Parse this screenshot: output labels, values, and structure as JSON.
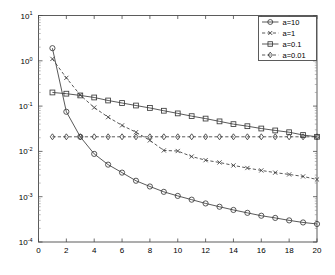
{
  "chart_data": {
    "type": "line",
    "title": "",
    "xlabel": "",
    "ylabel": "",
    "xlim": [
      0,
      20
    ],
    "ylim": [
      0.0001,
      10
    ],
    "yscale": "log",
    "xscale": "linear",
    "grid": false,
    "legend_position": "top-right",
    "x_ticks": [
      0,
      2,
      4,
      6,
      8,
      10,
      12,
      14,
      16,
      18,
      20
    ],
    "x_tick_labels": [
      "0",
      "2",
      "4",
      "6",
      "8",
      "10",
      "12",
      "14",
      "16",
      "18",
      "20"
    ],
    "y_ticks": [
      10,
      1,
      0.1,
      0.01,
      0.001,
      0.0001
    ],
    "y_tick_labels": [
      "10^1",
      "10^0",
      "10^-1",
      "10^-2",
      "10^-3",
      "10^-4"
    ],
    "y_tick_mantissa": [
      "10",
      "10",
      "10",
      "10",
      "10",
      "10"
    ],
    "y_tick_exponent": [
      "1",
      "0",
      "-1",
      "-2",
      "-3",
      "-4"
    ],
    "x": [
      1,
      2,
      3,
      4,
      5,
      6,
      7,
      8,
      9,
      10,
      11,
      12,
      13,
      14,
      15,
      16,
      17,
      18,
      19,
      20
    ],
    "series": [
      {
        "name": "a=10",
        "marker": "circle",
        "linestyle": "solid",
        "color": "#3b3b3b",
        "values": [
          1.9,
          0.075,
          0.021,
          0.0088,
          0.0051,
          0.0034,
          0.00225,
          0.00168,
          0.00128,
          0.00104,
          0.00086,
          0.00071,
          0.0006,
          0.00051,
          0.00044,
          0.00038,
          0.00034,
          0.0003,
          0.00027,
          0.00025
        ]
      },
      {
        "name": "a=1",
        "marker": "x",
        "linestyle": "dashed",
        "color": "#3b3b3b",
        "values": [
          1.1,
          0.42,
          0.175,
          0.093,
          0.057,
          0.0375,
          0.0265,
          0.0175,
          0.0105,
          0.0102,
          0.0077,
          0.0064,
          0.0057,
          0.0049,
          0.0043,
          0.0038,
          0.0034,
          0.0031,
          0.0028,
          0.0024
        ]
      },
      {
        "name": "a=0.1",
        "marker": "square",
        "linestyle": "solid",
        "color": "#3b3b3b",
        "values": [
          0.2,
          0.188,
          0.172,
          0.155,
          0.133,
          0.117,
          0.103,
          0.091,
          0.079,
          0.069,
          0.06,
          0.053,
          0.046,
          0.04,
          0.036,
          0.032,
          0.029,
          0.0265,
          0.023,
          0.021
        ]
      },
      {
        "name": "a=0.01",
        "marker": "diamond",
        "linestyle": "dashed",
        "color": "#3b3b3b",
        "values": [
          0.021,
          0.021,
          0.021,
          0.021,
          0.021,
          0.021,
          0.021,
          0.021,
          0.021,
          0.021,
          0.021,
          0.021,
          0.021,
          0.021,
          0.021,
          0.021,
          0.021,
          0.021,
          0.021,
          0.021
        ]
      }
    ],
    "legend_entries": [
      "a=10",
      "a=1",
      "a=0.1",
      "a=0.01"
    ]
  }
}
